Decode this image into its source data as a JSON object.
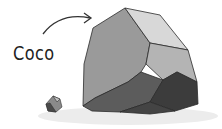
{
  "illustration": {
    "label": "Coco",
    "subject": "large faceted grey rock with a small pebble",
    "colors": {
      "background": "#ffffff",
      "shadow": "#ebebeb",
      "light_facet": "#d4d4d4",
      "mid_facet": "#9a9a9a",
      "dark_facet": "#5a5a5a",
      "darkest_facet": "#3c3c3c",
      "outline": "#2b2b2b"
    }
  }
}
